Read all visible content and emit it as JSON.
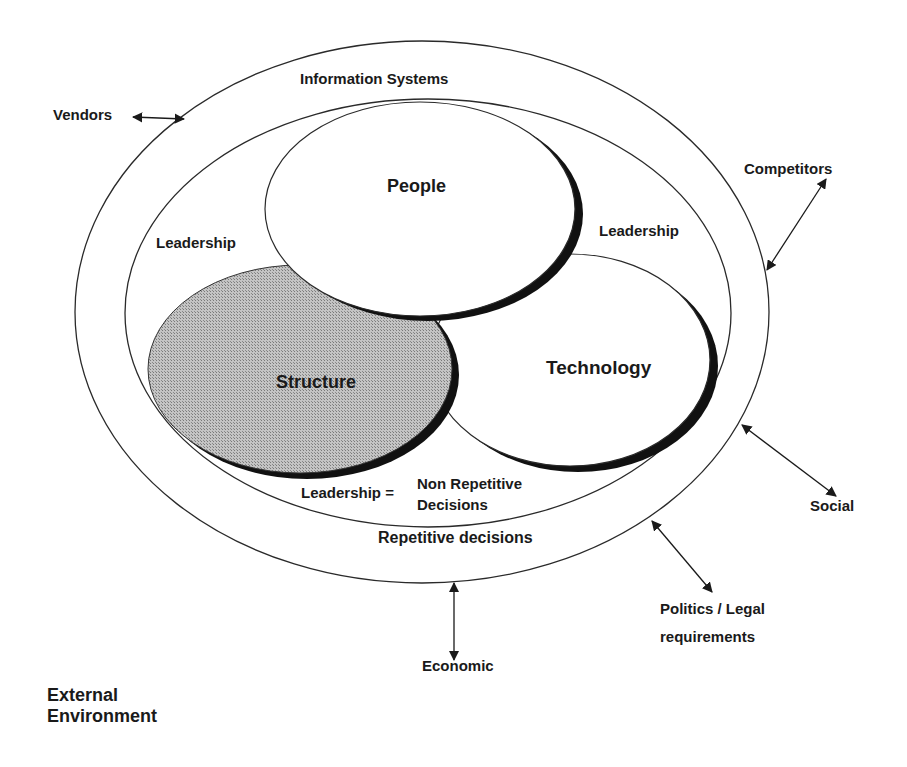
{
  "diagram": {
    "outer_ring_label": "Information Systems",
    "inner_ring_labels": {
      "left": "Leadership",
      "right": "Leadership"
    },
    "circles": {
      "people": "People",
      "structure": "Structure",
      "technology": "Technology"
    },
    "leadership_definition": {
      "term": "Leadership =",
      "definition_line1": "Non Repetitive",
      "definition_line2": "Decisions"
    },
    "outer_band_label": "Repetitive decisions",
    "external_forces": [
      {
        "label": "Vendors"
      },
      {
        "label": "Competitors"
      },
      {
        "label": "Social"
      },
      {
        "label": "Politics / Legal",
        "label_line2": "requirements"
      },
      {
        "label": "Economic"
      }
    ],
    "environment_label_line1": "External",
    "environment_label_line2": "Environment"
  },
  "colors": {
    "line": "#2a2a2a",
    "shadow": "#111111",
    "structure_fill": "#b8b8b8",
    "background": "#ffffff"
  }
}
